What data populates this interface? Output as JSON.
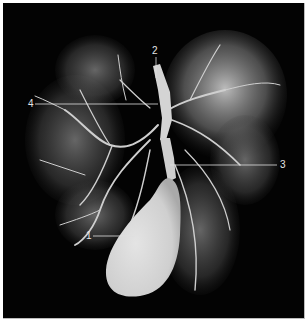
{
  "figure": {
    "background_color": "#030303",
    "cast_color": "#d9d9d9",
    "labels": [
      {
        "id": "1",
        "text": "1",
        "x": 86,
        "y": 231
      },
      {
        "id": "2",
        "text": "2",
        "x": 152,
        "y": 46
      },
      {
        "id": "3",
        "text": "3",
        "x": 280,
        "y": 160
      },
      {
        "id": "4",
        "text": "4",
        "x": 28,
        "y": 99
      }
    ]
  }
}
